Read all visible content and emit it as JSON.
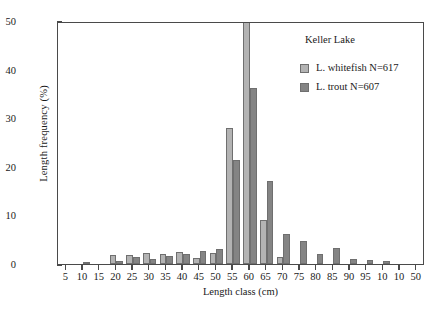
{
  "chart_data": {
    "type": "bar",
    "title": "",
    "annotation": "Keller Lake",
    "xlabel": "Length class (cm)",
    "ylabel": "Length frequency (%)",
    "xlim": [
      2.5,
      112.5
    ],
    "ylim": [
      0,
      50
    ],
    "yticks": [
      0,
      10,
      20,
      30,
      40,
      50
    ],
    "grid": false,
    "legend_position": "upper right",
    "categories": [
      5,
      10,
      15,
      20,
      25,
      30,
      35,
      40,
      45,
      50,
      55,
      60,
      65,
      70,
      75,
      80,
      85,
      90,
      95,
      100,
      105,
      110
    ],
    "tick_labels": [
      "5",
      "10",
      "15",
      "20",
      "25",
      "30",
      "35",
      "40",
      "45",
      "50",
      "55",
      "60",
      "65",
      "70",
      "75",
      "80",
      "85",
      "90",
      "95",
      "10",
      "10",
      "50"
    ],
    "series": [
      {
        "name": "L. whitefish N=617",
        "color": "#b3b3b3",
        "values": [
          0,
          0,
          0,
          1.9,
          1.9,
          2.3,
          2.1,
          2.4,
          1.3,
          2.2,
          28.0,
          62.0,
          9.1,
          1.4,
          0,
          0,
          0,
          0,
          0,
          0,
          0,
          0
        ]
      },
      {
        "name": "L. trout N=607",
        "color": "#848484",
        "values": [
          0,
          0.4,
          0,
          0.7,
          1.4,
          1.0,
          1.7,
          2.0,
          2.7,
          3.1,
          21.5,
          36.3,
          17.0,
          6.1,
          4.7,
          2.0,
          3.3,
          1.0,
          0.8,
          0.6,
          0,
          0
        ]
      }
    ]
  },
  "legend": {
    "lake_label": "Keller Lake",
    "entries": [
      {
        "label": "L. whitefish N=617"
      },
      {
        "label": "L. trout N=607"
      }
    ]
  },
  "axes": {
    "y_title": "Length frequency (%)",
    "x_title": "Length class (cm)"
  }
}
